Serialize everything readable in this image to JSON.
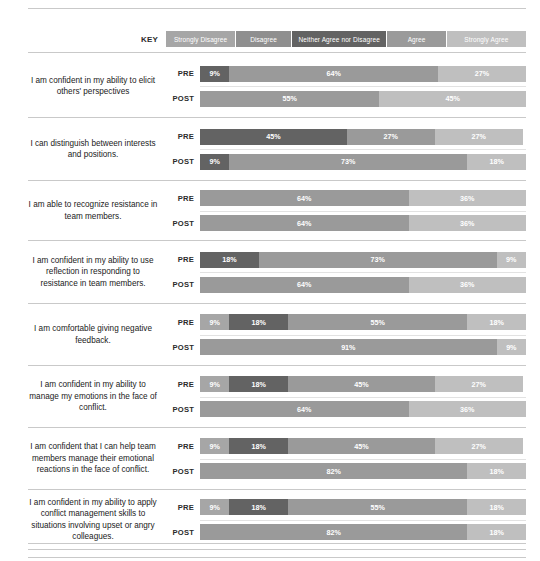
{
  "legend": {
    "key_label": "KEY",
    "items": [
      {
        "label": "Strongly Disagree",
        "color": "#a6a6a6"
      },
      {
        "label": "Disagree",
        "color": "#8f8f8f"
      },
      {
        "label": "Neither Agree nor Disagree",
        "color": "#636363"
      },
      {
        "label": "Agree",
        "color": "#9a9a9a"
      },
      {
        "label": "Strongly Agree",
        "color": "#bfbfbf"
      }
    ]
  },
  "series_labels": {
    "pre": "PRE",
    "post": "POST"
  },
  "chart_data": {
    "type": "bar",
    "subtype": "stacked-horizontal-100pct-diverging",
    "title": "",
    "xlabel": "",
    "ylabel": "",
    "xlim": [
      0,
      100
    ],
    "grid": false,
    "legend_position": "top",
    "legend": [
      "Strongly Disagree",
      "Disagree",
      "Neither Agree nor Disagree",
      "Agree",
      "Strongly Agree"
    ],
    "categories": [
      "I am confident in my ability to elicit others' perspectives",
      "I can distinguish between interests and positions.",
      "I am able to recognize resistance in team members.",
      "I am confident in my ability to use reflection in responding to resistance in team members.",
      "I am comfortable giving negative feedback.",
      "I am confident in my ability to manage my emotions in the face of conflict.",
      "I am confident that I can help team members manage their emotional reactions in the face of conflict.",
      "I am confident in my ability to apply conflict management skills to situations involving upset or angry colleagues."
    ],
    "groups": [
      "PRE",
      "POST"
    ],
    "rows": [
      {
        "question": "I am confident in my ability to elicit others' perspectives",
        "pre": [
          {
            "key": "Neither Agree nor Disagree",
            "value": 9,
            "label": "9%"
          },
          {
            "key": "Agree",
            "value": 64,
            "label": "64%"
          },
          {
            "key": "Strongly Agree",
            "value": 27,
            "label": "27%"
          }
        ],
        "post": [
          {
            "key": "Agree",
            "value": 55,
            "label": "55%"
          },
          {
            "key": "Strongly Agree",
            "value": 45,
            "label": "45%"
          }
        ]
      },
      {
        "question": "I can distinguish between interests and positions.",
        "pre": [
          {
            "key": "Neither Agree nor Disagree",
            "value": 45,
            "label": "45%"
          },
          {
            "key": "Agree",
            "value": 27,
            "label": "27%"
          },
          {
            "key": "Strongly Agree",
            "value": 27,
            "label": "27%"
          }
        ],
        "post": [
          {
            "key": "Neither Agree nor Disagree",
            "value": 9,
            "label": "9%"
          },
          {
            "key": "Agree",
            "value": 73,
            "label": "73%"
          },
          {
            "key": "Strongly Agree",
            "value": 18,
            "label": "18%"
          }
        ]
      },
      {
        "question": "I am able to recognize resistance in team members.",
        "pre": [
          {
            "key": "Agree",
            "value": 64,
            "label": "64%"
          },
          {
            "key": "Strongly Agree",
            "value": 36,
            "label": "36%"
          }
        ],
        "post": [
          {
            "key": "Agree",
            "value": 64,
            "label": "64%"
          },
          {
            "key": "Strongly Agree",
            "value": 36,
            "label": "36%"
          }
        ]
      },
      {
        "question": "I am confident in my ability to use reflection in responding to resistance in team members.",
        "pre": [
          {
            "key": "Neither Agree nor Disagree",
            "value": 18,
            "label": "18%"
          },
          {
            "key": "Agree",
            "value": 73,
            "label": "73%"
          },
          {
            "key": "Strongly Agree",
            "value": 9,
            "label": "9%"
          }
        ],
        "post": [
          {
            "key": "Agree",
            "value": 64,
            "label": "64%"
          },
          {
            "key": "Strongly Agree",
            "value": 36,
            "label": "36%"
          }
        ]
      },
      {
        "question": "I am comfortable giving negative feedback.",
        "pre": [
          {
            "key": "Strongly Disagree",
            "value": 9,
            "label": "9%"
          },
          {
            "key": "Neither Agree nor Disagree",
            "value": 18,
            "label": "18%"
          },
          {
            "key": "Agree",
            "value": 55,
            "label": "55%"
          },
          {
            "key": "Strongly Agree",
            "value": 18,
            "label": "18%"
          }
        ],
        "post": [
          {
            "key": "Agree",
            "value": 91,
            "label": "91%"
          },
          {
            "key": "Strongly Agree",
            "value": 9,
            "label": "9%"
          }
        ]
      },
      {
        "question": "I am confident in my ability to manage my emotions in the face of conflict.",
        "pre": [
          {
            "key": "Strongly Disagree",
            "value": 9,
            "label": "9%"
          },
          {
            "key": "Neither Agree nor Disagree",
            "value": 18,
            "label": "18%"
          },
          {
            "key": "Agree",
            "value": 45,
            "label": "45%"
          },
          {
            "key": "Strongly Agree",
            "value": 27,
            "label": "27%"
          }
        ],
        "post": [
          {
            "key": "Agree",
            "value": 64,
            "label": "64%"
          },
          {
            "key": "Strongly Agree",
            "value": 36,
            "label": "36%"
          }
        ]
      },
      {
        "question": "I am confident that I can help team members manage their emotional reactions in the face of conflict.",
        "pre": [
          {
            "key": "Strongly Disagree",
            "value": 9,
            "label": "9%"
          },
          {
            "key": "Neither Agree nor Disagree",
            "value": 18,
            "label": "18%"
          },
          {
            "key": "Agree",
            "value": 45,
            "label": "45%"
          },
          {
            "key": "Strongly Agree",
            "value": 27,
            "label": "27%"
          }
        ],
        "post": [
          {
            "key": "Agree",
            "value": 82,
            "label": "82%"
          },
          {
            "key": "Strongly Agree",
            "value": 18,
            "label": "18%"
          }
        ]
      },
      {
        "question": "I am confident in my ability to apply conflict management skills to situations involving upset or angry colleagues.",
        "pre": [
          {
            "key": "Strongly Disagree",
            "value": 9,
            "label": "9%"
          },
          {
            "key": "Neither Agree nor Disagree",
            "value": 18,
            "label": "18%"
          },
          {
            "key": "Agree",
            "value": 55,
            "label": "55%"
          },
          {
            "key": "Strongly Agree",
            "value": 18,
            "label": "18%"
          }
        ],
        "post": [
          {
            "key": "Agree",
            "value": 82,
            "label": "82%"
          },
          {
            "key": "Strongly Agree",
            "value": 18,
            "label": "18%"
          }
        ]
      }
    ]
  },
  "layout": {
    "block_tops": [
      55,
      118,
      181,
      241,
      304,
      366,
      428,
      490
    ],
    "block_heights": [
      63,
      63,
      60,
      63,
      62,
      62,
      62,
      60
    ]
  }
}
